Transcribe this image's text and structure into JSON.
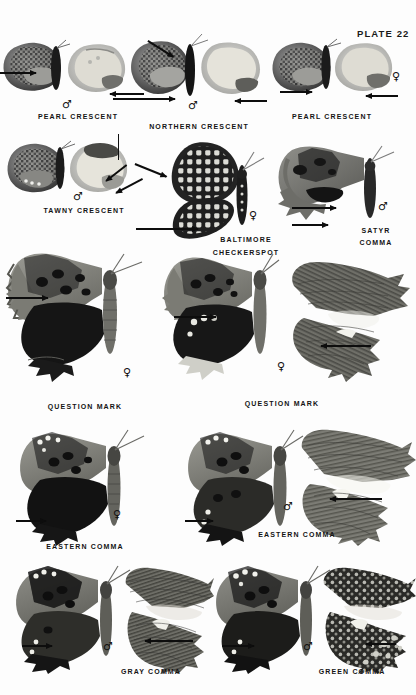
{
  "page": {
    "plate_label": "PLATE 22",
    "background_color": "#fdfdfd",
    "ink_color": "#141414",
    "width": 416,
    "height": 695
  },
  "symbols": {
    "male": "♂",
    "female": "♀"
  },
  "specimens": [
    {
      "id": "pearl-crescent-male",
      "caption": "PEARL CRESCENT",
      "sex": "♂",
      "caption_x": 78,
      "caption_y": 113,
      "sex_x": 67,
      "sex_y": 104,
      "row": 1
    },
    {
      "id": "northern-crescent-male",
      "caption": "NORTHERN CRESCENT",
      "sex": "♂",
      "caption_x": 199,
      "caption_y": 123,
      "sex_x": 193,
      "sex_y": 105,
      "row": 1
    },
    {
      "id": "pearl-crescent-female",
      "caption": "PEARL CRESCENT",
      "sex": "♀",
      "caption_x": 332,
      "caption_y": 113,
      "sex_x": 396,
      "sex_y": 76,
      "row": 1
    },
    {
      "id": "tawny-crescent-male",
      "caption": "TAWNY CRESCENT",
      "sex": "♂",
      "caption_x": 84,
      "caption_y": 207,
      "sex_x": 78,
      "sex_y": 196,
      "row": 2
    },
    {
      "id": "baltimore-checkerspot-female",
      "caption": "BALTIMORE",
      "caption2": "CHECKERSPOT",
      "sex": "♀",
      "caption_x": 246,
      "caption_y": 236,
      "caption2_x": 246,
      "caption2_y": 249,
      "sex_x": 253,
      "sex_y": 215,
      "row": 2
    },
    {
      "id": "satyr-comma-male",
      "caption": "SATYR",
      "caption2": "COMMA",
      "sex": "♂",
      "caption_x": 376,
      "caption_y": 227,
      "caption2_x": 376,
      "caption2_y": 239,
      "sex_x": 383,
      "sex_y": 206,
      "row": 2
    },
    {
      "id": "question-mark-female-left",
      "caption": "QUESTION MARK",
      "sex": "♀",
      "caption_x": 85,
      "caption_y": 403,
      "sex_x": 127,
      "sex_y": 372,
      "row": 3
    },
    {
      "id": "question-mark-female-right",
      "caption": "QUESTION MARK",
      "sex": "♀",
      "caption_x": 282,
      "caption_y": 400,
      "sex_x": 281,
      "sex_y": 366,
      "row": 3
    },
    {
      "id": "eastern-comma-female",
      "caption": "EASTERN COMMA",
      "sex": "♀",
      "caption_x": 85,
      "caption_y": 543,
      "sex_x": 117,
      "sex_y": 514,
      "row": 4
    },
    {
      "id": "eastern-comma-male",
      "caption": "EASTERN COMMA",
      "sex": "♂",
      "caption_x": 297,
      "caption_y": 531,
      "sex_x": 288,
      "sex_y": 506,
      "row": 4
    },
    {
      "id": "gray-comma-male",
      "caption": "GRAY COMMA",
      "sex": "♂",
      "caption_x": 151,
      "caption_y": 668,
      "sex_x": 108,
      "sex_y": 646,
      "row": 5
    },
    {
      "id": "green-comma-male",
      "caption": "GREEN COMMA",
      "sex": "♂",
      "caption_x": 352,
      "caption_y": 668,
      "sex_x": 308,
      "sex_y": 646,
      "row": 5
    }
  ]
}
